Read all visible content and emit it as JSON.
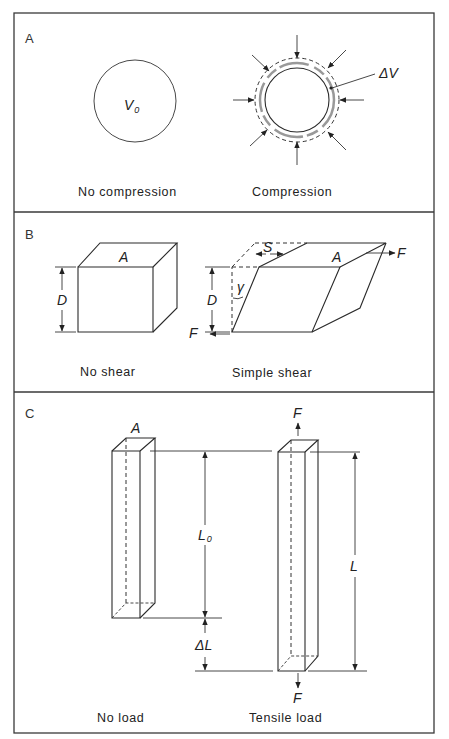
{
  "figure": {
    "panels": [
      {
        "id": "A",
        "label": "A",
        "left_caption": "No compression",
        "right_caption": "Compression",
        "volume_label": "V",
        "volume_subscript": "0",
        "delta_label": "ΔV"
      },
      {
        "id": "B",
        "label": "B",
        "left_caption": "No shear",
        "right_caption": "Simple shear",
        "area_label": "A",
        "depth_label": "D",
        "displacement_label": "S",
        "angle_label": "γ",
        "force_label": "F"
      },
      {
        "id": "C",
        "label": "C",
        "left_caption": "No load",
        "right_caption": "Tensile load",
        "area_label": "A",
        "length0_label": "L",
        "length0_subscript": "0",
        "length_label": "L",
        "delta_label": "ΔL",
        "force_label": "F"
      }
    ]
  }
}
